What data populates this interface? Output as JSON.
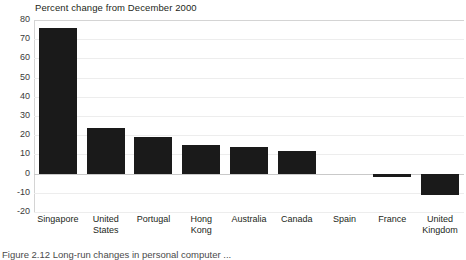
{
  "chart_data": {
    "type": "bar",
    "title": "Percent change from December 2000",
    "xlabel": "",
    "ylabel": "",
    "ylim": [
      -20,
      80
    ],
    "ytick_step": 10,
    "grid": true,
    "legend": null,
    "bar_color": "#1a1a1a",
    "categories": [
      "Singapore",
      "United States",
      "Portugal",
      "Hong Kong",
      "Australia",
      "Canada",
      "Spain",
      "France",
      "United Kingdom"
    ],
    "category_lines": [
      [
        "Singapore"
      ],
      [
        "United",
        "States"
      ],
      [
        "Portugal"
      ],
      [
        "Hong",
        "Kong"
      ],
      [
        "Australia"
      ],
      [
        "Canada"
      ],
      [
        "Spain"
      ],
      [
        "France"
      ],
      [
        "United",
        "Kingdom"
      ]
    ],
    "values": [
      76,
      24,
      19,
      15,
      14,
      12,
      0,
      -2,
      -11
    ],
    "yticks": [
      80,
      70,
      60,
      50,
      40,
      30,
      20,
      10,
      0,
      -10,
      -20
    ],
    "ytick_labels": [
      "80",
      "70",
      "60",
      "50",
      "40",
      "30",
      "20",
      "10",
      "0",
      "-10",
      "-20"
    ]
  },
  "caption": {
    "text": "Figure 2.12   Long-run changes in personal computer ..."
  }
}
